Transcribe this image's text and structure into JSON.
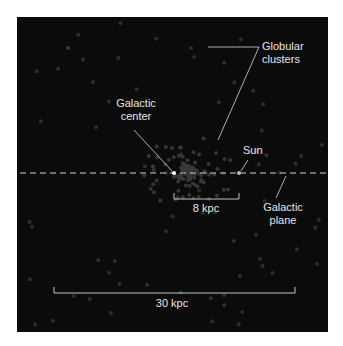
{
  "diagram": {
    "background_color": "#0b0b0b",
    "label_color": "#e6e6e6",
    "labels": {
      "globular_clusters_line1": "Globular",
      "globular_clusters_line2": "clusters",
      "galactic_center_line1": "Galactic",
      "galactic_center_line2": "center",
      "sun": "Sun",
      "galactic_plane_line1": "Galactic",
      "galactic_plane_line2": "plane",
      "scale_small": "8 kpc",
      "scale_large": "30 kpc"
    },
    "markers": {
      "galactic_center": {
        "x": 174,
        "y": 173
      },
      "sun": {
        "x": 239,
        "y": 173
      }
    },
    "galactic_plane_y": 173,
    "scale_bars": {
      "small": {
        "x1": 174,
        "x2": 239,
        "y": 199
      },
      "large": {
        "x1": 54,
        "x2": 295,
        "y": 293
      }
    }
  }
}
